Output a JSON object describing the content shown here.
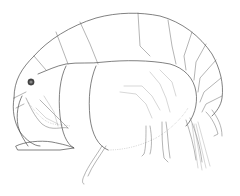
{
  "figure": {
    "style": "scientific line drawing, lateral view",
    "background": "#ffffff",
    "line_color": "#4a4a4a",
    "eye_color": "#333333"
  }
}
